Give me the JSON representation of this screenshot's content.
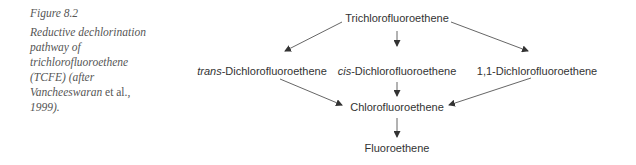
{
  "caption": {
    "figure_label": "Figure 8.2",
    "text_part1": "Reductive dechlorination pathway of trichlorofluoroethene (TCFE) (after ",
    "author": "Vancheeswaran",
    "etal": " et al.,",
    "year": " 1999)."
  },
  "nodes": {
    "tcfe": "Trichlorofluoroethene",
    "trans_prefix": "trans",
    "trans_rest": "-Dichlorofluoroethene",
    "cis_prefix": "cis",
    "cis_rest": "-Dichlorofluoroethene",
    "dcfe11": "1,1-Dichlorofluoroethene",
    "cfe": "Chlorofluoroethene",
    "fe": "Fluoroethene"
  },
  "colors": {
    "text": "#333333",
    "caption": "#555555",
    "arrow": "#444444"
  }
}
